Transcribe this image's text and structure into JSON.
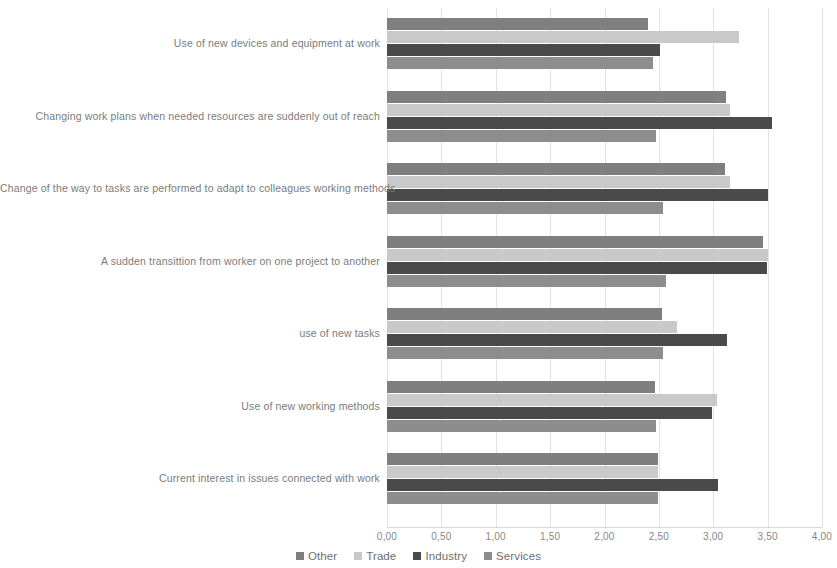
{
  "chart_data": {
    "type": "bar",
    "orientation": "horizontal",
    "title": "",
    "subtitle": "",
    "xlabel": "",
    "ylabel": "",
    "xlim": [
      0,
      4
    ],
    "xticks": [
      0,
      0.5,
      1,
      1.5,
      2,
      2.5,
      3,
      3.5,
      4
    ],
    "xtick_labels": [
      "0,00",
      "0,50",
      "1,00",
      "1,50",
      "2,00",
      "2,50",
      "3,00",
      "3,50",
      "4,00"
    ],
    "grid": true,
    "grid_axis": "x",
    "legend_position": "bottom",
    "categories": [
      "Use of new devices and equipment at work",
      "Changing work plans when needed resources are suddenly out of reach",
      "Change of the way to tasks are performed to adapt to colleagues working methods",
      "A sudden transittion from worker on one project to another",
      "use of new tasks",
      "Use of new working methods",
      "Current interest in issues connected with work"
    ],
    "series": [
      {
        "name": "Other",
        "color": "#7f7f7f",
        "values": [
          2.4,
          3.12,
          3.11,
          3.46,
          2.53,
          2.46,
          2.49
        ]
      },
      {
        "name": "Trade",
        "color": "#c9c9c9",
        "values": [
          3.24,
          3.15,
          3.15,
          3.5,
          2.67,
          3.03,
          2.49
        ]
      },
      {
        "name": "Industry",
        "color": "#4a4a4a",
        "values": [
          2.51,
          3.54,
          3.5,
          3.49,
          3.13,
          2.99,
          3.04
        ]
      },
      {
        "name": "Services",
        "color": "#8d8d8d",
        "values": [
          2.45,
          2.47,
          2.54,
          2.57,
          2.54,
          2.47,
          2.49
        ]
      }
    ]
  },
  "colors": {
    "background": "#ffffff",
    "gridline": "#e3e3e3",
    "axis": "#d9d9d9",
    "text": "#7b7b7b"
  }
}
